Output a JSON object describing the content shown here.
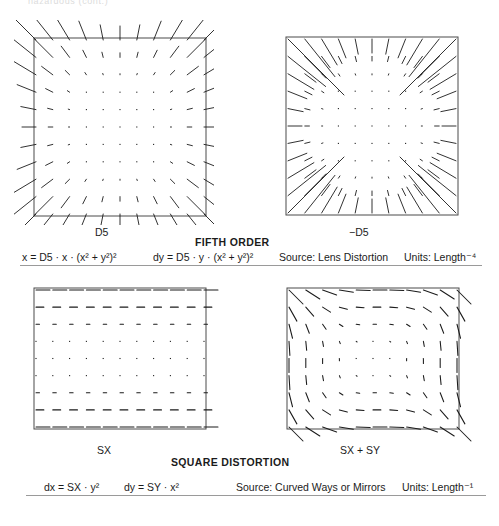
{
  "page": {
    "top_cropped_text": "hazardous (cont.)",
    "background": "#ffffff",
    "ink": "#1b1b1b"
  },
  "sections": [
    {
      "id": "fifth-order",
      "title": "FIFTH ORDER",
      "panels": [
        {
          "id": "d5",
          "label": "D5"
        },
        {
          "id": "neg-d5",
          "label": "−D5"
        }
      ],
      "formula_dx": "x = D5 · x · (x² + y²)²",
      "formula_dy": "dy = D5 · y · (x² + y²)²",
      "source": "Source: Lens Distortion",
      "units": "Units: Length⁻⁴"
    },
    {
      "id": "square-distortion",
      "title": "SQUARE DISTORTION",
      "panels": [
        {
          "id": "sx",
          "label": "SX"
        },
        {
          "id": "sx-sy",
          "label": "SX + SY"
        }
      ],
      "formula_dx": "dx = SX · y²",
      "formula_dy": "dy = SY · x²",
      "source": "Source: Curved Ways or Mirrors",
      "units": "Units: Length⁻¹"
    }
  ],
  "chart_data": [
    {
      "type": "scatter",
      "id": "d5",
      "title": "D5",
      "plot_kind": "vector-field-quiver",
      "grid": "11x11 sample lattice over a square domain",
      "xlim": [
        -1,
        1
      ],
      "ylim": [
        -1,
        1
      ],
      "vector_field": {
        "dx": "D5 * x * (x^2 + y^2)^2",
        "dy": "D5 * y * (x^2 + y^2)^2"
      },
      "coefficient": 1,
      "direction": "outward (pincushion)",
      "magnitude_profile": "r^5, near zero at center, maximum at corners",
      "border": true,
      "legend": "none"
    },
    {
      "type": "scatter",
      "id": "neg-d5",
      "title": "−D5",
      "plot_kind": "vector-field-quiver",
      "grid": "11x11 sample lattice over a square domain",
      "xlim": [
        -1,
        1
      ],
      "ylim": [
        -1,
        1
      ],
      "vector_field": {
        "dx": "-D5 * x * (x^2 + y^2)^2",
        "dy": "-D5 * y * (x^2 + y^2)^2"
      },
      "coefficient": -1,
      "direction": "inward (barrel)",
      "magnitude_profile": "r^5, near zero at center, maximum at corners",
      "border": true,
      "legend": "none"
    },
    {
      "type": "scatter",
      "id": "sx",
      "title": "SX",
      "plot_kind": "vector-field-quiver",
      "grid": "11x9 sample lattice over a square domain",
      "xlim": [
        -1,
        1
      ],
      "ylim": [
        -1,
        1
      ],
      "vector_field": {
        "dx": "SX * y^2",
        "dy": "0"
      },
      "direction": "purely horizontal, +x",
      "magnitude_profile": "proportional to y^2, zero along the horizontal midline, maximum at top and bottom rows",
      "border": true,
      "legend": "none"
    },
    {
      "type": "scatter",
      "id": "sx-sy",
      "title": "SX + SY",
      "plot_kind": "vector-field-quiver",
      "grid": "11x9 sample lattice over a square domain",
      "xlim": [
        -1,
        1
      ],
      "ylim": [
        -1,
        1
      ],
      "vector_field": {
        "dx": "SX * y^2",
        "dy": "SY * x^2"
      },
      "direction": "combined horizontal (y^2) and vertical (x^2)",
      "magnitude_profile": "zero at center, maximum at corners",
      "border": true,
      "legend": "none"
    }
  ]
}
